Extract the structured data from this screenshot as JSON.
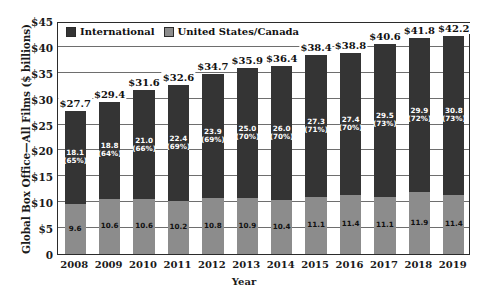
{
  "chart_data": {
    "type": "bar",
    "subtype": "stacked-column",
    "title": "",
    "xlabel": "Year",
    "ylabel": "Global Box Office—All Films ($ billions)",
    "ylim": [
      0,
      45
    ],
    "yticks": [
      0,
      5,
      10,
      15,
      20,
      25,
      30,
      35,
      40,
      45
    ],
    "ytick_labels": [
      "0",
      "$5",
      "$10",
      "$15",
      "$20",
      "$25",
      "$30",
      "$35",
      "$40",
      "$45"
    ],
    "grid": true,
    "legend_position": "top-left-inside",
    "categories": [
      "2008",
      "2009",
      "2010",
      "2011",
      "2012",
      "2013",
      "2014",
      "2015",
      "2016",
      "2017",
      "2018",
      "2019"
    ],
    "series": [
      {
        "name": "United States/Canada",
        "color": "#8c8c8c",
        "values": [
          9.6,
          10.6,
          10.6,
          10.2,
          10.8,
          10.9,
          10.4,
          11.1,
          11.4,
          11.1,
          11.9,
          11.4
        ],
        "labels": [
          "9.6",
          "10.6",
          "10.6",
          "10.2",
          "10.8",
          "10.9",
          "10.4",
          "11.1",
          "11.4",
          "11.1",
          "11.9",
          "11.4"
        ]
      },
      {
        "name": "International",
        "color": "#343434",
        "values": [
          18.1,
          18.8,
          21.0,
          22.4,
          23.9,
          25.0,
          26.0,
          27.3,
          27.4,
          29.5,
          29.9,
          30.8
        ],
        "percent_labels": [
          "(65%)",
          "(64%)",
          "(66%)",
          "(69%)",
          "(69%)",
          "(70%)",
          "(70%)",
          "(71%)",
          "(70%)",
          "(73%)",
          "(72%)",
          "(73%)"
        ],
        "labels": [
          "18.1",
          "18.8",
          "21.0",
          "22.4",
          "23.9",
          "25.0",
          "26.0",
          "27.3",
          "27.4",
          "29.5",
          "29.9",
          "30.8"
        ]
      }
    ],
    "totals": [
      27.7,
      29.4,
      31.6,
      32.6,
      34.7,
      35.9,
      36.4,
      38.4,
      38.8,
      40.6,
      41.8,
      42.2
    ],
    "total_labels": [
      "$27.7",
      "$29.4",
      "$31.6",
      "$32.6",
      "$34.7",
      "$35.9",
      "$36.4",
      "$38.4",
      "$38.8",
      "$40.6",
      "$41.8",
      "$42.2"
    ]
  },
  "legend": {
    "items": [
      {
        "label": "International",
        "color": "#343434"
      },
      {
        "label": "United States/Canada",
        "color": "#8c8c8c"
      }
    ]
  },
  "colors": {
    "international": "#343434",
    "united_states_canada": "#8c8c8c",
    "axis": "#2b2b2b",
    "gridline": "#6e6e6e",
    "background": "#ffffff"
  }
}
